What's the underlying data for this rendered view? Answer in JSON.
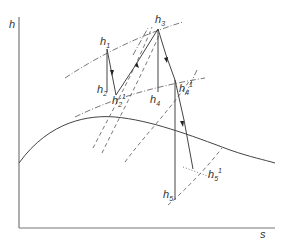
{
  "diagram": {
    "type": "h-s (Mollier) diagram",
    "axes": {
      "y_label": "h",
      "x_label": "s"
    },
    "points": [
      {
        "id": "h1",
        "label": "h",
        "sub": "1",
        "sup": ""
      },
      {
        "id": "h2",
        "label": "h",
        "sub": "2",
        "sup": ""
      },
      {
        "id": "h2a",
        "label": "h",
        "sub": "2",
        "sup": "1"
      },
      {
        "id": "h3",
        "label": "h",
        "sub": "3",
        "sup": ""
      },
      {
        "id": "h4",
        "label": "h",
        "sub": "4",
        "sup": ""
      },
      {
        "id": "h4a",
        "label": "h",
        "sub": "4",
        "sup": "1"
      },
      {
        "id": "h5",
        "label": "h",
        "sub": "5",
        "sup": ""
      },
      {
        "id": "h5a",
        "label": "h",
        "sub": "5",
        "sup": "1"
      }
    ],
    "colors": {
      "line": "#444444",
      "background": "#ffffff"
    }
  }
}
